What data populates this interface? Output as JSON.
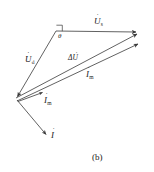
{
  "figure": {
    "caption": "(b)",
    "background_color": "#ffffff",
    "line_color": "#3a3a3a",
    "text_color": "#1a1a1a"
  },
  "labels": {
    "u_s": {
      "symbol": "U",
      "subscript": "s",
      "overdot": true
    },
    "u_d": {
      "symbol": "U",
      "subscript": "d",
      "overdot": true
    },
    "delta_u": {
      "symbol": "ΔU",
      "overdot": true
    },
    "i_m_upper": {
      "symbol": "I",
      "subscript": "m",
      "overdot": true
    },
    "i_m_lower": {
      "symbol": "I",
      "subscript": "m",
      "overdot": true
    },
    "i": {
      "symbol": "I",
      "overdot": true
    },
    "theta": {
      "symbol": "θ"
    }
  },
  "vectors": [
    {
      "name": "U_s",
      "from": [
        56,
        31
      ],
      "to": [
        140,
        32
      ],
      "label": "U_s",
      "arrow": true
    },
    {
      "name": "U_d",
      "from": [
        56,
        31
      ],
      "to": [
        16,
        98
      ],
      "label": "U_d",
      "arrow": true
    },
    {
      "name": "Delta_U",
      "from": [
        16,
        98
      ],
      "to": [
        141,
        33
      ],
      "label": "Delta U",
      "arrow": true
    },
    {
      "name": "I_m",
      "from": [
        17,
        101
      ],
      "to": [
        142,
        43
      ],
      "label": "I_m",
      "arrow": true
    },
    {
      "name": "I_m_short",
      "from": [
        18,
        101
      ],
      "to": [
        44,
        92
      ],
      "label": "I_m short",
      "arrow": true
    },
    {
      "name": "I",
      "from": [
        17,
        100
      ],
      "to": [
        48,
        137
      ],
      "label": "I",
      "arrow": true
    }
  ],
  "angle_marker": {
    "name": "right-angle-at-apex",
    "vertex": [
      56,
      31
    ],
    "theta_label": "θ"
  }
}
